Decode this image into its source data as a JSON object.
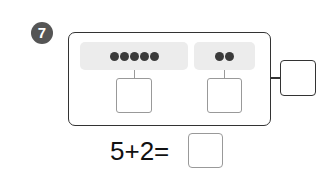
{
  "problem": {
    "number": "7",
    "groups": [
      {
        "dot_count": 5
      },
      {
        "dot_count": 2
      }
    ],
    "equation": {
      "text": "5+2=",
      "left_operand": "5",
      "operator": "+",
      "right_operand": "2",
      "answer": ""
    },
    "colors": {
      "badge": "#555555",
      "panel": "#ececec",
      "dot": "#3a3a3a",
      "outline": "#333333",
      "answer_box_border": "#999999"
    }
  }
}
